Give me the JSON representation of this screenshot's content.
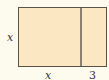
{
  "diagram": {
    "shape": "rectangle divided into square and strip",
    "fill_color": "#fbe8c3",
    "border_color": "#5a5448",
    "labels": {
      "left_side": "x",
      "bottom_square": "x",
      "bottom_strip": "3"
    }
  }
}
